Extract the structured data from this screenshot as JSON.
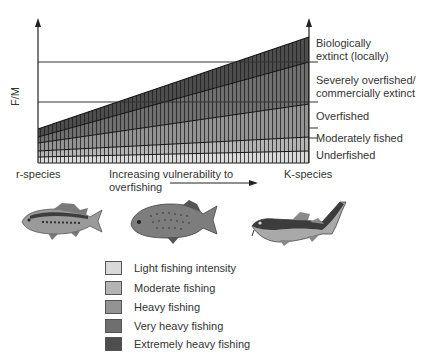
{
  "diagram": {
    "y_axis_label": "F/M",
    "x_axis": {
      "left_label": "r-species",
      "middle_label_line1": "Increasing vulnerability to",
      "middle_label_line2": "overfishing",
      "right_label": "K-species"
    },
    "status_labels": [
      {
        "line1": "Biologically",
        "line2": "extinct (locally)"
      },
      {
        "line1": "Severely overfished/",
        "line2": "commercially extinct"
      },
      {
        "line1": "Overfished",
        "line2": ""
      },
      {
        "line1": "Moderately fished",
        "line2": ""
      },
      {
        "line1": "Underfished",
        "line2": ""
      }
    ],
    "fish": [
      {
        "name": "r-species fish (bass)"
      },
      {
        "name": "intermediate fish (grouper)"
      },
      {
        "name": "K-species fish (cod)"
      }
    ],
    "legend": [
      {
        "label": "Light fishing intensity",
        "color": "#d9d9d9"
      },
      {
        "label": "Moderate fishing",
        "color": "#b4b4b4"
      },
      {
        "label": "Heavy fishing",
        "color": "#939393"
      },
      {
        "label": "Very heavy fishing",
        "color": "#6f6f6f"
      },
      {
        "label": "Extremely heavy fishing",
        "color": "#4d4d4d"
      }
    ]
  }
}
